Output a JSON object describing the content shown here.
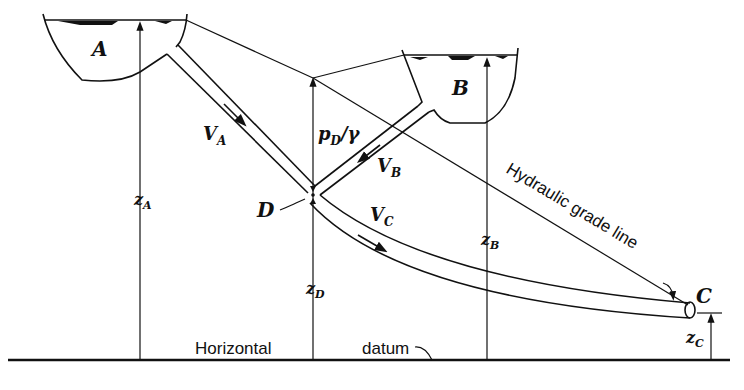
{
  "figure": {
    "reservoirs": [
      {
        "label": "A"
      },
      {
        "label": "B"
      }
    ],
    "labels": {
      "reservoir_a": "A",
      "reservoir_b": "B",
      "junction": "D",
      "outlet": "C",
      "velocity_a": "V",
      "velocity_a_sub": "A",
      "velocity_b": "V",
      "velocity_b_sub": "B",
      "velocity_c": "V",
      "velocity_c_sub": "C",
      "pressure_head": "p",
      "pressure_head_sub": "D",
      "pressure_head_suffix": "/γ",
      "elevation_a": "z",
      "elevation_a_sub": "A",
      "elevation_b": "z",
      "elevation_b_sub": "B",
      "elevation_d": "z",
      "elevation_d_sub": "D",
      "elevation_c": "z",
      "elevation_c_sub": "C",
      "hgl": "Hydraulic grade line",
      "datum_left": "Horizontal",
      "datum_right": "datum"
    }
  }
}
